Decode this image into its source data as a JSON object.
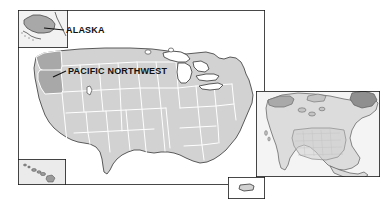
{
  "figure": {
    "type": "reference-map",
    "background_color": "#ffffff"
  },
  "colors": {
    "land_fill": "#d2d2d2",
    "land_fill_locator": "#d8d8d8",
    "highlight_fill": "#a8a8a8",
    "water_fill": "#ffffff",
    "state_border": "#ffffff",
    "coast_outline": "#4a4a4a",
    "frame_border": "#1a1a1a",
    "label_text": "#111111",
    "leader_line": "#111111"
  },
  "labels": [
    {
      "id": "alaska",
      "text": "ALASKA",
      "bold": true,
      "font_size_px": 9,
      "leader_line": true,
      "points_to": "alaska-inset"
    },
    {
      "id": "pacific-northwest",
      "text": "PACIFIC NORTHWEST",
      "bold": true,
      "font_size_px": 9,
      "leader_line": true,
      "points_to": "highlighted-states"
    }
  ],
  "highlighted_region": {
    "name": "Pacific Northwest",
    "states": [
      "Washington",
      "Oregon"
    ],
    "also_highlighted": [
      "Alaska"
    ],
    "fill": "#a8a8a8"
  },
  "panels": [
    {
      "id": "main-map",
      "name": "Contiguous United States",
      "framed": true
    },
    {
      "id": "alaska-inset",
      "name": "Alaska inset",
      "framed": true
    },
    {
      "id": "hawaii-inset",
      "name": "Hawaii inset",
      "framed": true
    },
    {
      "id": "territory-inset",
      "name": "Territory inset",
      "framed": true
    },
    {
      "id": "locator-map",
      "name": "North America locator map",
      "framed": true
    }
  ]
}
